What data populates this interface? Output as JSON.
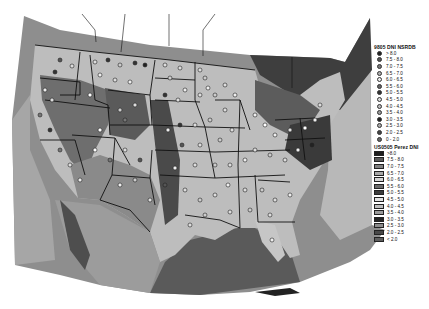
{
  "map": {
    "description": "Contiguous United States DNI map with NSRDB station dots over gridded Perez DNI raster (grayscale)",
    "region": "United States"
  },
  "legend_points": {
    "title": "9805 DNI NSRDB",
    "items": [
      {
        "label": "> 8.0",
        "fill": "#222222"
      },
      {
        "label": "7.5 - 8.0",
        "fill": "#555555"
      },
      {
        "label": "7.0 - 7.5",
        "fill": "#777777"
      },
      {
        "label": "6.5 - 7.0",
        "fill": "#aaaaaa"
      },
      {
        "label": "6.0 - 6.5",
        "fill": "#eeeeee"
      },
      {
        "label": "5.5 - 6.0",
        "fill": "#666666"
      },
      {
        "label": "5.0 - 5.5",
        "fill": "#333333"
      },
      {
        "label": "4.5 - 5.0",
        "fill": "#dddddd"
      },
      {
        "label": "4.0 - 4.5",
        "fill": "#bbbbbb"
      },
      {
        "label": "3.5 - 4.0",
        "fill": "#999999"
      },
      {
        "label": "3.0 - 3.5",
        "fill": "#222222"
      },
      {
        "label": "2.5 - 3.0",
        "fill": "#aaaaaa"
      },
      {
        "label": "2.0 - 2.5",
        "fill": "#444444"
      },
      {
        "label": "0 - 2.0",
        "fill": "#666666"
      }
    ]
  },
  "legend_raster": {
    "title": "US0505 Perez DNI",
    "items": [
      {
        "label": ">8.0",
        "fill": "#1e1e1e"
      },
      {
        "label": "7.5 - 8.0",
        "fill": "#5a5a5a"
      },
      {
        "label": "7.0 - 7.5",
        "fill": "#808080"
      },
      {
        "label": "6.5 - 7.0",
        "fill": "#a8a8a8"
      },
      {
        "label": "6.0 - 6.5",
        "fill": "#d4d4d4"
      },
      {
        "label": "5.5 - 6.0",
        "fill": "#6a6a6a"
      },
      {
        "label": "5.0 - 5.5",
        "fill": "#3c3c3c"
      },
      {
        "label": "4.5 - 5.0",
        "fill": "#e2e2e2"
      },
      {
        "label": "4.0 - 4.5",
        "fill": "#bcbcbc"
      },
      {
        "label": "3.5 - 4.0",
        "fill": "#9a9a9a"
      },
      {
        "label": "3.0 - 3.5",
        "fill": "#262626"
      },
      {
        "label": "2.5 - 3.0",
        "fill": "#8c8c8c"
      },
      {
        "label": "2.0 - 2.5",
        "fill": "#484848"
      },
      {
        "label": "< 2.0",
        "fill": "#5e5e5e"
      }
    ]
  }
}
